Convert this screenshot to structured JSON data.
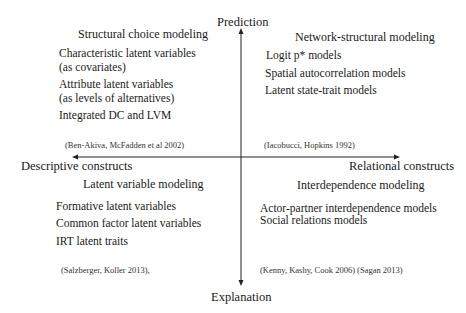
{
  "axes": {
    "top": "Prediction",
    "bottom": "Explanation",
    "left": "Descriptive constructs",
    "right": "Relational constructs"
  },
  "quadrants": {
    "top_left": {
      "title": "Structural choice modeling",
      "items": [
        "Characteristic latent variables",
        "(as covariates)",
        "Attribute latent variables",
        "(as levels of alternatives)",
        "Integrated DC and  LVM"
      ],
      "reference": "(Ben-Akiva, McFadden et al 2002)"
    },
    "top_right": {
      "title": "Network-structural modeling",
      "items": [
        "Logit p* models",
        "Spatial autocorrelation models",
        "Latent state-trait models"
      ],
      "reference": "(Iacobucci, Hopkins 1992)"
    },
    "bottom_left": {
      "title": "Latent variable modeling",
      "items": [
        "Formative latent variables",
        "Common factor latent variables",
        "IRT latent traits"
      ],
      "reference": "(Salzberger, Koller 2013),"
    },
    "bottom_right": {
      "title": "Interdependence modeling",
      "items": [
        "Actor-partner interdependence models",
        "Social relations models"
      ],
      "reference": "(Kenny, Kashy, Cook  2006) (Sagan 2013)"
    }
  }
}
